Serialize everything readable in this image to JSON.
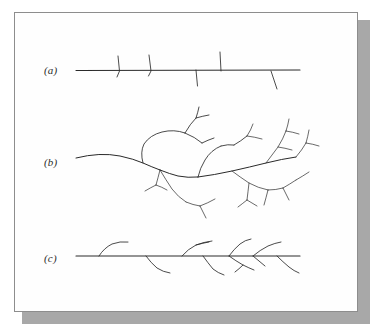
{
  "figure": {
    "title": "",
    "background_color": "#fefefe",
    "frame_border_color": "#8d8d8d",
    "shadow_color": "#a8a8a8",
    "ink_color": "#2a2a2a",
    "panel_count": 3
  },
  "panels": [
    {
      "id": "a",
      "label": "(a)",
      "description": "horizontal axis with short unbranched stubs",
      "branch_order": 1,
      "axis": {
        "x1": 76,
        "y1": 70,
        "x2": 300,
        "y2": 71
      },
      "stub_count": 5
    },
    {
      "id": "b",
      "label": "(b)",
      "description": "dense dendritic tree with multiple branching generations",
      "branch_order": 4,
      "axis": {
        "x1": 76,
        "y1": 157,
        "x2": 300,
        "y2": 160
      },
      "stub_count": 0
    },
    {
      "id": "c",
      "label": "(c)",
      "description": "horizontal axis with curved hook and V shaped side branches",
      "branch_order": 2,
      "axis": {
        "x1": 76,
        "y1": 256,
        "x2": 300,
        "y2": 256
      },
      "stub_count": 8
    }
  ],
  "chart_data": {
    "type": "diagram",
    "title": "",
    "xlabel": "",
    "ylabel": "",
    "series": [
      {
        "name": "(a)",
        "values": [
          "M76,70.5 L300,70.0",
          "M118,56 L119.5,71 L117,77",
          "M149,55 L151,71 L148.5,76",
          "M196,70 L197.5,86",
          "M220,52 L221,71",
          "M271,71 L277,89"
        ]
      },
      {
        "name": "(b)",
        "values": [
          "M76,158 Q100,152 120,156 Q134,159 143,163 Q152,167 160,170",
          "M160,170 Q170,174 178,176 Q188,178 198,177",
          "M198,177 Q214,175 232,171 Q250,167 266,163 Q282,159 296,157",
          "M143,163 Q140,152 144,144 Q150,135 162,132 Q174,129 185,133",
          "M185,133 Q195,137 202,143",
          "M185,133 Q190,124 196,118",
          "M196,118 Q198,112 199,107",
          "M196,118 Q203,116 209,115",
          "M202,143 Q208,140 214,138",
          "M198,177 Q200,168 205,160 Q211,150 221,146",
          "M221,146 Q228,144 234,145",
          "M234,145 Q241,141 247,136",
          "M247,136 Q251,130 253,124",
          "M247,136 Q255,137 262,139",
          "M160,170 Q158,178 156,185",
          "M156,185 Q150,188 145,191",
          "M156,185 Q162,187 167,190",
          "M160,170 Q166,180 172,189 Q178,197 186,202",
          "M186,202 Q193,205 200,206",
          "M200,206 Q208,203 215,199",
          "M200,206 Q203,212 206,218",
          "M232,171 Q240,177 249,183 Q258,188 268,190",
          "M268,190 Q276,190 283,188",
          "M283,188 Q290,184 296,180",
          "M283,188 Q286,194 289,200",
          "M268,190 Q266,198 264,205",
          "M266,163 Q272,155 278,147 Q283,139 286,131",
          "M286,131 Q288,125 289,119",
          "M286,131 Q293,132 299,134",
          "M278,147 Q285,148 292,150",
          "M296,157 Q302,150 306,143",
          "M306,143 Q308,136 309,130",
          "M306,143 Q313,144 319,146",
          "M296,180 Q303,176 309,172",
          "M249,183 Q248,192 247,200",
          "M247,200 Q242,204 238,207",
          "M247,200 Q252,203 257,206"
        ]
      },
      {
        "name": "(c)",
        "values": [
          "M76,256 L300,256",
          "M99,256 Q104,248 112,244 Q120,241 128,242",
          "M146,256 Q151,263 157,268 Q163,272 170,273",
          "M182,256 Q188,249 196,245 Q204,242 212,241",
          "M196,245 Q203,243 209,242",
          "M203,256 Q208,263 213,269 Q218,273 224,275",
          "M229,256 Q234,249 240,244 Q245,240 251,239",
          "M229,256 Q236,261 243,265 Q249,268 254,270",
          "M243,265 Q239,269 235,272",
          "M253,256 Q260,250 268,246 Q275,243 281,242",
          "M253,256 Q259,261 265,266",
          "M277,256 Q283,262 289,267 Q294,271 299,273"
        ]
      }
    ]
  }
}
